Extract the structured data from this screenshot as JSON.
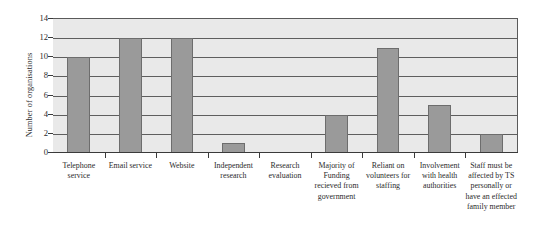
{
  "chart_data": {
    "type": "bar",
    "title": "",
    "subtitle": "",
    "xlabel": "",
    "ylabel": "Number of organisations",
    "ylim": [
      0,
      14
    ],
    "ytick_step": 2,
    "yticks": [
      14,
      12,
      10,
      8,
      6,
      4,
      2,
      0
    ],
    "grid": true,
    "grid_axis": "y",
    "legend": false,
    "legend_position": "none",
    "categories": [
      "Telephone service",
      "Email service",
      "Website",
      "Independent research",
      "Research evaluation",
      "Majority of Funding recieved from government",
      "Reliant on volunteers for staffing",
      "Involvement with health authorities",
      "Staff must be affected by TS personally or have an effected family member"
    ],
    "values": [
      10,
      12,
      12,
      1,
      0,
      4,
      11,
      5,
      2
    ],
    "series": [
      {
        "name": "Number of organisations",
        "values": [
          10,
          12,
          12,
          1,
          0,
          4,
          11,
          5,
          2
        ]
      }
    ],
    "colors": {
      "bar_fill": "#9a9a9a",
      "bar_stroke": "#6d6d6d",
      "plot_background": "#e9e9e9",
      "gridline": "#5e5e5e",
      "axis": "#3a3a3a",
      "text": "#2b2b2b",
      "page_background": "#ffffff"
    }
  }
}
